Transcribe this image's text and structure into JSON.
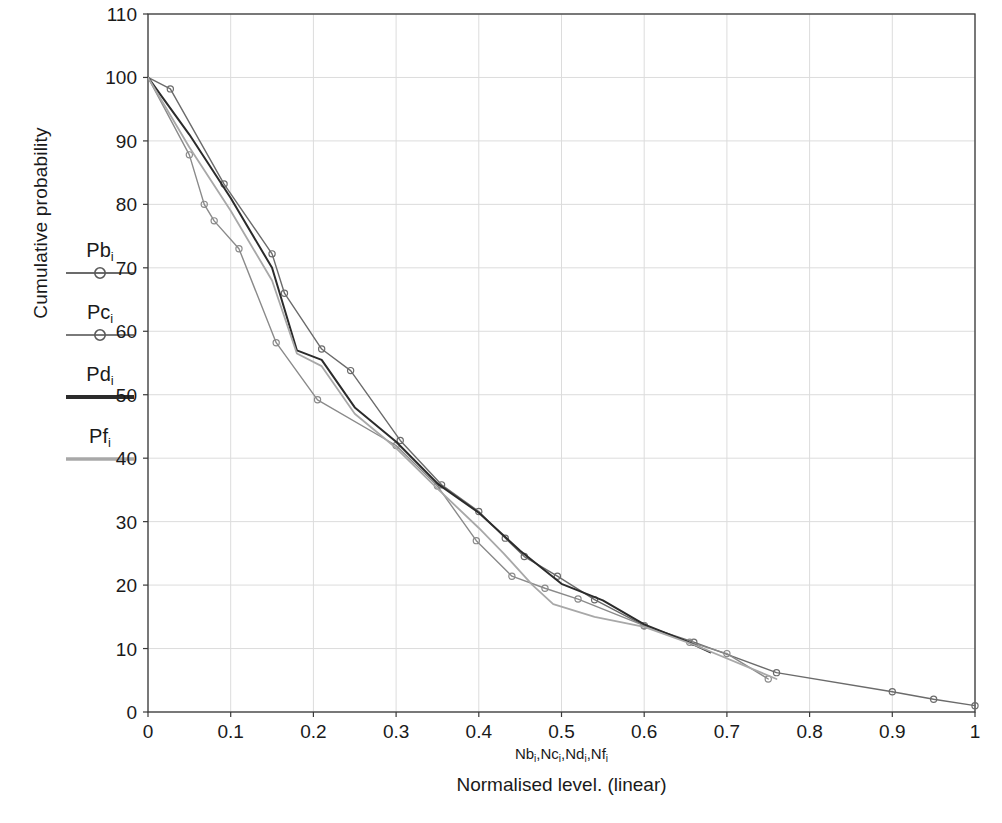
{
  "chart_data": {
    "type": "line",
    "title": "",
    "subtitle": "",
    "xlabel": "Normalised level. (linear)",
    "xlabel_symbols": "Nb,Nc,Nd,Nf",
    "ylabel": "Cumulative probability",
    "xlim": [
      0,
      1
    ],
    "ylim": [
      0,
      110
    ],
    "xticks": [
      "0",
      "0.1",
      "0.2",
      "0.3",
      "0.4",
      "0.5",
      "0.6",
      "0.7",
      "0.8",
      "0.9",
      "1"
    ],
    "xtick_values": [
      0,
      0.1,
      0.2,
      0.3,
      0.4,
      0.5,
      0.6,
      0.7,
      0.8,
      0.9,
      1
    ],
    "yticks": [
      "0",
      "10",
      "20",
      "30",
      "40",
      "50",
      "60",
      "70",
      "80",
      "90",
      "100",
      "110"
    ],
    "ytick_values": [
      0,
      10,
      20,
      30,
      40,
      50,
      60,
      70,
      80,
      90,
      100,
      110
    ],
    "grid": true,
    "legend_position": "outside-left",
    "series": [
      {
        "name": "Pb",
        "color": "#6b6b6b",
        "marker": "circle",
        "width": 1.4,
        "points": [
          [
            0.0,
            100.0
          ],
          [
            0.027,
            98.2
          ],
          [
            0.092,
            83.2
          ],
          [
            0.15,
            72.2
          ],
          [
            0.165,
            66.0
          ],
          [
            0.21,
            57.2
          ],
          [
            0.245,
            53.8
          ],
          [
            0.305,
            42.8
          ],
          [
            0.355,
            35.8
          ],
          [
            0.4,
            31.6
          ],
          [
            0.432,
            27.4
          ],
          [
            0.455,
            24.5
          ],
          [
            0.495,
            21.4
          ],
          [
            0.54,
            17.7
          ],
          [
            0.6,
            13.6
          ],
          [
            0.66,
            11.0
          ],
          [
            0.76,
            6.2
          ],
          [
            0.9,
            3.2
          ],
          [
            0.95,
            2.0
          ],
          [
            1.0,
            1.0
          ]
        ]
      },
      {
        "name": "Pc",
        "color": "#8a8a8a",
        "marker": "circle",
        "width": 1.4,
        "points": [
          [
            0.0,
            100.0
          ],
          [
            0.05,
            87.8
          ],
          [
            0.068,
            80.0
          ],
          [
            0.08,
            77.4
          ],
          [
            0.11,
            73.0
          ],
          [
            0.155,
            58.2
          ],
          [
            0.205,
            49.2
          ],
          [
            0.3,
            42.0
          ],
          [
            0.35,
            35.6
          ],
          [
            0.397,
            27.0
          ],
          [
            0.44,
            21.4
          ],
          [
            0.48,
            19.5
          ],
          [
            0.52,
            17.8
          ],
          [
            0.6,
            13.6
          ],
          [
            0.655,
            11.0
          ],
          [
            0.7,
            9.2
          ],
          [
            0.75,
            5.2
          ]
        ]
      },
      {
        "name": "Pd",
        "color": "#2b2b2b",
        "marker": "none",
        "width": 2.0,
        "points": [
          [
            0.0,
            100.0
          ],
          [
            0.05,
            91.0
          ],
          [
            0.1,
            81.0
          ],
          [
            0.15,
            70.0
          ],
          [
            0.18,
            57.0
          ],
          [
            0.21,
            55.5
          ],
          [
            0.25,
            48.0
          ],
          [
            0.3,
            42.6
          ],
          [
            0.35,
            36.0
          ],
          [
            0.4,
            31.4
          ],
          [
            0.45,
            25.4
          ],
          [
            0.5,
            20.2
          ],
          [
            0.55,
            17.6
          ],
          [
            0.6,
            13.8
          ],
          [
            0.65,
            11.2
          ],
          [
            0.68,
            9.4
          ]
        ]
      },
      {
        "name": "Pf",
        "color": "#a8a8a8",
        "marker": "none",
        "width": 1.8,
        "points": [
          [
            0.0,
            100.0
          ],
          [
            0.05,
            89.0
          ],
          [
            0.1,
            79.0
          ],
          [
            0.15,
            68.0
          ],
          [
            0.18,
            56.5
          ],
          [
            0.21,
            54.5
          ],
          [
            0.25,
            47.0
          ],
          [
            0.3,
            41.6
          ],
          [
            0.35,
            35.2
          ],
          [
            0.4,
            29.0
          ],
          [
            0.43,
            25.0
          ],
          [
            0.465,
            20.0
          ],
          [
            0.49,
            17.0
          ],
          [
            0.54,
            15.0
          ],
          [
            0.6,
            13.4
          ],
          [
            0.66,
            10.6
          ],
          [
            0.76,
            5.2
          ]
        ]
      }
    ]
  },
  "legend": {
    "entries": [
      {
        "label": "Pb",
        "subscript": "i",
        "style": "line-marker",
        "color": "#6b6b6b"
      },
      {
        "label": "Pc",
        "subscript": "i",
        "style": "line-marker",
        "color": "#7a7a7a"
      },
      {
        "label": "Pd",
        "subscript": "i",
        "style": "thick-line",
        "color": "#2b2b2b"
      },
      {
        "label": "Pf",
        "subscript": "i",
        "style": "thick-line",
        "color": "#a8a8a8"
      }
    ]
  },
  "axes": {
    "ylabel": "Cumulative probability",
    "xlabel_symbolic_prefixes": [
      "Nb",
      "Nc",
      "Nd",
      "Nf"
    ],
    "xlabel_caption": "Normalised level. (linear)"
  },
  "colors": {
    "axis": "#3a3a3a",
    "grid": "#dcdcdc",
    "text": "#1a1a1a",
    "background": "#ffffff"
  }
}
